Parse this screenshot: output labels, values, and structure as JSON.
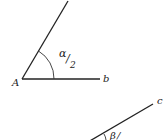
{
  "diagram": {
    "angle1": {
      "vertex_label": "A",
      "ray_label": "b",
      "angle_label_main": "α",
      "angle_label_slash": "/",
      "angle_label_denom": "2"
    },
    "angle2": {
      "ray_label": "c",
      "angle_label_main": "β",
      "angle_label_slash": "/"
    },
    "stroke_color": "#222222"
  }
}
